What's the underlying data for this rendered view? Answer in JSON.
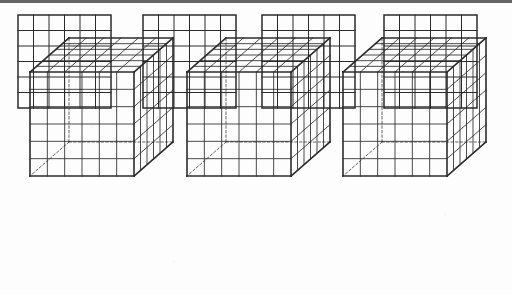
{
  "figure": {
    "background_color": "#fdfdfd",
    "line_color": "#2b2b2b",
    "hidden_line_color": "#555555",
    "scan_border_color": "#4a4a4a",
    "canvas": {
      "width": 512,
      "height": 297
    }
  },
  "squares_row": {
    "label": "row-of-square-grids",
    "count": 4,
    "grid_columns": 6,
    "grid_rows": 6,
    "cell_size": 15.5,
    "outer_stroke_width": 1.5,
    "inner_stroke_width": 1.0,
    "y": 15,
    "items": [
      {
        "name": "square-grid-1",
        "x": 18
      },
      {
        "name": "square-grid-2",
        "x": 143
      },
      {
        "name": "square-grid-3",
        "x": 262
      },
      {
        "name": "square-grid-4",
        "x": 384
      }
    ]
  },
  "cubes_row": {
    "label": "row-of-unit-cubes",
    "count": 3,
    "divisions_x": 6,
    "divisions_y": 6,
    "divisions_z": 6,
    "face_size": 104,
    "depth_dx": 39,
    "depth_dy": -34,
    "outer_stroke_width": 1.6,
    "inner_stroke_width": 0.85,
    "hidden_stroke_width": 0.9,
    "hidden_dash": "2.4,2.2",
    "y": 176,
    "items": [
      {
        "name": "unit-cube-1",
        "x": 30
      },
      {
        "name": "unit-cube-2",
        "x": 187
      },
      {
        "name": "unit-cube-3",
        "x": 343
      }
    ]
  }
}
